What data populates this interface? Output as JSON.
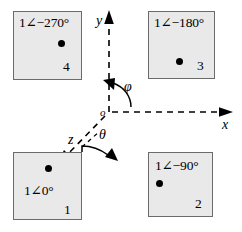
{
  "figure": {
    "background": "#ffffff",
    "box_fill": "#e9e9e9",
    "box_stroke": "#6b6b6b",
    "ink": "#000000"
  },
  "axes": {
    "x_label": "x",
    "y_label": "y",
    "z_label": "z",
    "origin_label": "o",
    "style": "dashed",
    "arrowheads": [
      "x-positive",
      "y-positive",
      "z-positive"
    ]
  },
  "angles": [
    {
      "name": "phi-angle-label",
      "label": "φ",
      "from_axis": "x",
      "to_axis": "y"
    },
    {
      "name": "theta-angle-label",
      "label": "θ",
      "from_axis": "z",
      "to_axis": "x"
    }
  ],
  "quadrants": [
    {
      "id": "box4",
      "number": "4",
      "phasor": "1∠−270°",
      "position": "top-left",
      "dot": {
        "x": 45,
        "y": 29
      }
    },
    {
      "id": "box3",
      "number": "3",
      "phasor": "1∠−180°",
      "position": "top-right",
      "dot": {
        "x": 28,
        "y": 47
      }
    },
    {
      "id": "box1",
      "number": "1",
      "phasor": "1∠0°",
      "position": "bottom-left",
      "dot": {
        "x": 32,
        "y": 13
      }
    },
    {
      "id": "box2",
      "number": "2",
      "phasor": "1∠−90°",
      "position": "bottom-right",
      "dot": {
        "x": 8,
        "y": 28
      }
    }
  ]
}
